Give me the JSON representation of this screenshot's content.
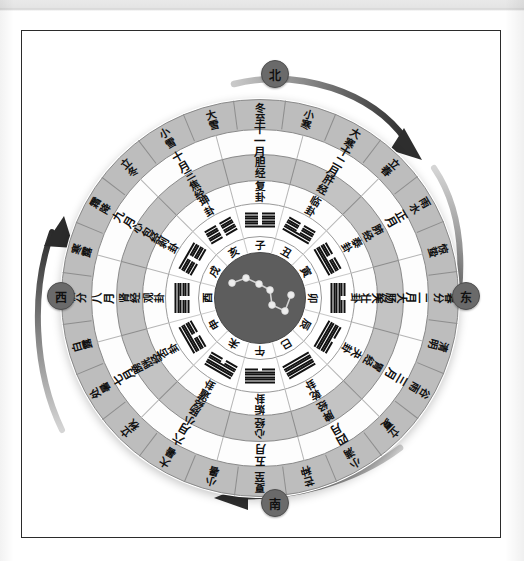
{
  "figure": {
    "kind": "circular-almanac-diagram"
  },
  "directions": [
    {
      "name": "north",
      "label": "北",
      "position": "top"
    },
    {
      "name": "east",
      "label": "东",
      "position": "right"
    },
    {
      "name": "south",
      "label": "南",
      "position": "bottom"
    },
    {
      "name": "west",
      "label": "西",
      "position": "left"
    }
  ],
  "rings": {
    "solar_terms": {
      "ring_name": "二十四节气",
      "count": 24,
      "items": [
        "冬至",
        "小寒",
        "大寒",
        "立春",
        "雨水",
        "惊蛰",
        "春分",
        "清明",
        "谷雨",
        "立夏",
        "小满",
        "芒种",
        "夏至",
        "小暑",
        "大暑",
        "立秋",
        "处暑",
        "白露",
        "秋分",
        "寒露",
        "霜降",
        "立冬",
        "小雪",
        "大雪"
      ]
    },
    "months": {
      "ring_name": "十二月",
      "count": 12,
      "items": [
        "十一月",
        "十二月",
        "正月",
        "二月",
        "三月",
        "四月",
        "五月",
        "六月",
        "七月",
        "八月",
        "九月",
        "十月"
      ]
    },
    "meridians": {
      "ring_name": "十二经络",
      "count": 12,
      "items": [
        "胆经",
        "肝经",
        "肺经",
        "大肠经",
        "胃经",
        "脾经",
        "心经",
        "小肠经",
        "膀胱经",
        "肾经",
        "心包经",
        "三焦经"
      ]
    },
    "hexagram_names": {
      "ring_name": "十二消息卦",
      "count": 12,
      "items": [
        "复卦",
        "临卦",
        "泰卦",
        "大壮卦",
        "夬卦",
        "乾卦",
        "姤卦",
        "遁卦",
        "否卦",
        "观卦",
        "剥卦",
        "坤卦"
      ]
    },
    "hexagram_glyphs": {
      "ring_name": "卦象",
      "count": 12,
      "note": "每卦六爻，自下而上；1=阳爻(实线) 0=阴爻(断线)",
      "items": [
        {
          "name": "复卦",
          "lines": [
            1,
            0,
            0,
            0,
            0,
            0
          ]
        },
        {
          "name": "临卦",
          "lines": [
            1,
            1,
            0,
            0,
            0,
            0
          ]
        },
        {
          "name": "泰卦",
          "lines": [
            1,
            1,
            1,
            0,
            0,
            0
          ]
        },
        {
          "name": "大壮卦",
          "lines": [
            1,
            1,
            1,
            1,
            0,
            0
          ]
        },
        {
          "name": "夬卦",
          "lines": [
            1,
            1,
            1,
            1,
            1,
            0
          ]
        },
        {
          "name": "乾卦",
          "lines": [
            1,
            1,
            1,
            1,
            1,
            1
          ]
        },
        {
          "name": "姤卦",
          "lines": [
            0,
            1,
            1,
            1,
            1,
            1
          ]
        },
        {
          "name": "遁卦",
          "lines": [
            0,
            0,
            1,
            1,
            1,
            1
          ]
        },
        {
          "name": "否卦",
          "lines": [
            0,
            0,
            0,
            1,
            1,
            1
          ]
        },
        {
          "name": "观卦",
          "lines": [
            0,
            0,
            0,
            0,
            1,
            1
          ]
        },
        {
          "name": "剥卦",
          "lines": [
            0,
            0,
            0,
            0,
            0,
            1
          ]
        },
        {
          "name": "坤卦",
          "lines": [
            0,
            0,
            0,
            0,
            0,
            0
          ]
        }
      ]
    },
    "earthly_branches": {
      "ring_name": "十二地支",
      "count": 12,
      "items": [
        "子",
        "丑",
        "寅",
        "卯",
        "辰",
        "巳",
        "午",
        "未",
        "申",
        "酉",
        "戌",
        "亥"
      ]
    }
  },
  "center": {
    "name": "北斗七星",
    "star_count": 7,
    "stars": [
      {
        "x": 17,
        "y": 30
      },
      {
        "x": 31,
        "y": 25
      },
      {
        "x": 44,
        "y": 31
      },
      {
        "x": 55,
        "y": 37
      },
      {
        "x": 57,
        "y": 52
      },
      {
        "x": 70,
        "y": 58
      },
      {
        "x": 76,
        "y": 42
      }
    ]
  },
  "arrows": [
    {
      "name": "arrow-top-right",
      "direction": "clockwise"
    },
    {
      "name": "arrow-right",
      "direction": "clockwise"
    },
    {
      "name": "arrow-bottom",
      "direction": "clockwise"
    },
    {
      "name": "arrow-left",
      "direction": "clockwise"
    }
  ],
  "colors": {
    "band_gray": "#bdbdbd",
    "band_white": "#fdfdfd",
    "center_disc": "#5d5d5d",
    "ink": "#111111",
    "rule": "#8a8a8a",
    "marker": "#6a6a6a"
  }
}
